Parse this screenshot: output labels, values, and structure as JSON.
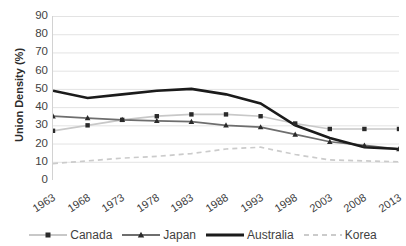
{
  "chart_data": {
    "type": "line",
    "title": "",
    "xlabel": "",
    "ylabel": "Union Density (%)",
    "categories": [
      "1963",
      "1968",
      "1973",
      "1978",
      "1983",
      "1988",
      "1993",
      "1998",
      "2003",
      "2008",
      "2013"
    ],
    "ylim": [
      0,
      90
    ],
    "ytick_labels": [
      "90",
      "80",
      "70",
      "60",
      "50",
      "40",
      "30",
      "20",
      "10",
      "0"
    ],
    "yticks": [
      90,
      80,
      70,
      60,
      50,
      40,
      30,
      20,
      10,
      0
    ],
    "grid": true,
    "legend_position": "bottom",
    "series": [
      {
        "name": "Canada",
        "color": "#c8c8c8",
        "marker": "square",
        "linestyle": "solid",
        "values": [
          27,
          30,
          33,
          35,
          36,
          36,
          35,
          31,
          28,
          28,
          28
        ]
      },
      {
        "name": "Japan",
        "color": "#6e6e6e",
        "marker": "triangle",
        "linestyle": "solid",
        "values": [
          35,
          34,
          33,
          32.5,
          32,
          30,
          29,
          25,
          21,
          19,
          17
        ]
      },
      {
        "name": "Australia",
        "color": "#1b1b1b",
        "marker": "none",
        "linestyle": "solid",
        "values": [
          49,
          45,
          47,
          49,
          50,
          47,
          42,
          30,
          23,
          18,
          17
        ]
      },
      {
        "name": "Korea",
        "color": "#cbcbcb",
        "marker": "none",
        "linestyle": "dashed",
        "values": [
          9,
          10.5,
          12,
          13,
          14.5,
          17,
          18,
          14,
          11,
          10.5,
          10
        ]
      }
    ]
  },
  "legend": {
    "items": [
      {
        "label": "Canada"
      },
      {
        "label": "Japan"
      },
      {
        "label": "Australia"
      },
      {
        "label": "Korea"
      }
    ]
  }
}
